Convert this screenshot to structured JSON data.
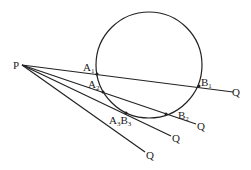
{
  "diagram": {
    "circle": {
      "cx": 149,
      "cy": 65,
      "r": 53
    },
    "point_P": {
      "label": "P",
      "x": 22,
      "y": 65
    },
    "lines": [
      {
        "name": "secant-1",
        "end": [
          235,
          92
        ],
        "labels": {
          "A": "A",
          "A_sub": "1",
          "B": "B",
          "B_sub": "1",
          "Q": "Q"
        }
      },
      {
        "name": "secant-2",
        "end": [
          198,
          125
        ],
        "labels": {
          "A": "A",
          "A_sub": "2",
          "B": "B",
          "B_sub": "2",
          "Q": "Q"
        }
      },
      {
        "name": "tangent",
        "end": [
          173,
          138
        ],
        "labels": {
          "A": "A",
          "A_sub": "3",
          "B": "B",
          "B_sub": "3",
          "Q": "Q"
        }
      },
      {
        "name": "outside-line",
        "end": [
          148,
          155
        ],
        "labels": {
          "Q": "Q"
        }
      }
    ]
  }
}
